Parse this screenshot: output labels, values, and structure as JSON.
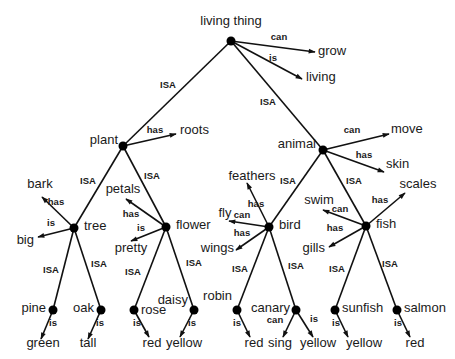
{
  "colors": {
    "line": "#111111",
    "node": "#000000",
    "text": "#1a1a1a",
    "background": "#ffffff"
  },
  "nodes": [
    {
      "id": "living_thing",
      "label": "living thing",
      "x": 231,
      "y": 41,
      "lx": 231,
      "ly": 25,
      "anchor": "middle"
    },
    {
      "id": "plant",
      "label": "plant",
      "x": 123,
      "y": 146,
      "lx": 118,
      "ly": 144,
      "anchor": "end"
    },
    {
      "id": "animal",
      "label": "animal",
      "x": 323,
      "y": 150,
      "lx": 316,
      "ly": 148,
      "anchor": "end"
    },
    {
      "id": "tree",
      "label": "tree",
      "x": 74,
      "y": 228,
      "lx": 84,
      "ly": 230,
      "anchor": "start"
    },
    {
      "id": "flower",
      "label": "flower",
      "x": 166,
      "y": 227,
      "lx": 176,
      "ly": 229,
      "anchor": "start"
    },
    {
      "id": "bird",
      "label": "bird",
      "x": 269,
      "y": 227,
      "lx": 279,
      "ly": 229,
      "anchor": "start"
    },
    {
      "id": "fish",
      "label": "fish",
      "x": 366,
      "y": 226,
      "lx": 376,
      "ly": 228,
      "anchor": "start"
    },
    {
      "id": "pine",
      "label": "pine",
      "x": 53,
      "y": 310,
      "lx": 46,
      "ly": 312,
      "anchor": "end"
    },
    {
      "id": "oak",
      "label": "oak",
      "x": 101,
      "y": 310,
      "lx": 94,
      "ly": 312,
      "anchor": "end"
    },
    {
      "id": "rose",
      "label": "rose",
      "x": 134,
      "y": 310,
      "lx": 141,
      "ly": 314,
      "anchor": "start"
    },
    {
      "id": "daisy",
      "label": "daisy",
      "x": 194,
      "y": 310,
      "lx": 188,
      "ly": 304,
      "anchor": "end"
    },
    {
      "id": "robin",
      "label": "robin",
      "x": 237,
      "y": 310,
      "lx": 232,
      "ly": 300,
      "anchor": "end"
    },
    {
      "id": "canary",
      "label": "canary",
      "x": 296,
      "y": 310,
      "lx": 290,
      "ly": 312,
      "anchor": "end"
    },
    {
      "id": "sunfish",
      "label": "sunfish",
      "x": 335,
      "y": 310,
      "lx": 342,
      "ly": 312,
      "anchor": "start"
    },
    {
      "id": "salmon",
      "label": "salmon",
      "x": 397,
      "y": 310,
      "lx": 404,
      "ly": 312,
      "anchor": "start"
    }
  ],
  "isa_edges": [
    {
      "from": "living_thing",
      "to": "plant",
      "label": "ISA",
      "lx": 168,
      "ly": 88
    },
    {
      "from": "living_thing",
      "to": "animal",
      "label": "ISA",
      "lx": 268,
      "ly": 105
    },
    {
      "from": "plant",
      "to": "tree",
      "label": "ISA",
      "lx": 88,
      "ly": 184
    },
    {
      "from": "plant",
      "to": "flower",
      "label": "ISA",
      "lx": 152,
      "ly": 179
    },
    {
      "from": "animal",
      "to": "bird",
      "label": "ISA",
      "lx": 288,
      "ly": 184
    },
    {
      "from": "animal",
      "to": "fish",
      "label": "ISA",
      "lx": 354,
      "ly": 184
    },
    {
      "from": "tree",
      "to": "pine",
      "label": "ISA",
      "lx": 51,
      "ly": 273
    },
    {
      "from": "tree",
      "to": "oak",
      "label": "ISA",
      "lx": 99,
      "ly": 267
    },
    {
      "from": "flower",
      "to": "rose",
      "label": "ISA",
      "lx": 133,
      "ly": 275
    },
    {
      "from": "flower",
      "to": "daisy",
      "label": "ISA",
      "lx": 194,
      "ly": 266
    },
    {
      "from": "bird",
      "to": "robin",
      "label": "ISA",
      "lx": 240,
      "ly": 272
    },
    {
      "from": "bird",
      "to": "canary",
      "label": "ISA",
      "lx": 296,
      "ly": 269
    },
    {
      "from": "fish",
      "to": "sunfish",
      "label": "ISA",
      "lx": 337,
      "ly": 272
    },
    {
      "from": "fish",
      "to": "salmon",
      "label": "ISA",
      "lx": 390,
      "ly": 267
    }
  ],
  "property_edges": [
    {
      "from": "living_thing",
      "tx": 315,
      "ty": 52,
      "rel": "can",
      "rlx": 279,
      "rly": 40,
      "value": "grow",
      "vx": 318,
      "vy": 55,
      "anchor": "start"
    },
    {
      "from": "living_thing",
      "tx": 302,
      "ty": 79,
      "rel": "is",
      "rlx": 273,
      "rly": 61,
      "value": "living",
      "vx": 306,
      "vy": 81,
      "anchor": "start"
    },
    {
      "from": "plant",
      "tx": 176,
      "ty": 134,
      "rel": "has",
      "rlx": 155,
      "rly": 133,
      "value": "roots",
      "vx": 180,
      "vy": 134,
      "anchor": "start"
    },
    {
      "from": "animal",
      "tx": 389,
      "ty": 134,
      "rel": "can",
      "rlx": 352,
      "rly": 133,
      "value": "move",
      "vx": 391,
      "vy": 133,
      "anchor": "start"
    },
    {
      "from": "animal",
      "tx": 384,
      "ty": 172,
      "rel": "has",
      "rlx": 364,
      "rly": 158,
      "value": "skin",
      "vx": 386,
      "vy": 168,
      "anchor": "start"
    },
    {
      "from": "tree",
      "tx": 42,
      "ty": 197,
      "rel": "has",
      "rlx": 56,
      "rly": 205,
      "value": "bark",
      "vx": 40,
      "vy": 188,
      "anchor": "middle"
    },
    {
      "from": "tree",
      "tx": 38,
      "ty": 237,
      "rel": "is",
      "rlx": 51,
      "rly": 226,
      "value": "big",
      "vx": 34,
      "vy": 244,
      "anchor": "end"
    },
    {
      "from": "flower",
      "tx": 126,
      "ty": 199,
      "rel": "has",
      "rlx": 131,
      "rly": 217,
      "value": "petals",
      "vx": 123,
      "vy": 193,
      "anchor": "middle"
    },
    {
      "from": "flower",
      "tx": 131,
      "ty": 241,
      "rel": "is",
      "rlx": 141,
      "rly": 231,
      "value": "pretty",
      "vx": 131,
      "vy": 252,
      "anchor": "middle"
    },
    {
      "from": "bird",
      "tx": 247,
      "ty": 183,
      "rel": "has",
      "rlx": 256,
      "rly": 207,
      "value": "feathers",
      "vx": 252,
      "vy": 180,
      "anchor": "middle"
    },
    {
      "from": "bird",
      "tx": 229,
      "ty": 221,
      "rel": "can",
      "rlx": 242,
      "rly": 218,
      "value": "fly",
      "vx": 225,
      "vy": 217,
      "anchor": "middle"
    },
    {
      "from": "bird",
      "tx": 236,
      "ty": 250,
      "rel": "has",
      "rlx": 242,
      "rly": 236,
      "value": "wings",
      "vx": 234,
      "vy": 252,
      "anchor": "end"
    },
    {
      "from": "fish",
      "tx": 323,
      "ty": 210,
      "rel": "can",
      "rlx": 340,
      "rly": 212,
      "value": "swim",
      "vx": 319,
      "vy": 204,
      "anchor": "middle"
    },
    {
      "from": "fish",
      "tx": 329,
      "ty": 247,
      "rel": "has",
      "rlx": 335,
      "rly": 231,
      "value": "gills",
      "vx": 325,
      "vy": 252,
      "anchor": "end"
    },
    {
      "from": "fish",
      "tx": 405,
      "ty": 193,
      "rel": "has",
      "rlx": 380,
      "rly": 203,
      "value": "scales",
      "vx": 418,
      "vy": 188,
      "anchor": "middle"
    },
    {
      "from": "pine",
      "tx": 41,
      "ty": 339,
      "rel": "is",
      "rlx": 53,
      "rly": 326,
      "value": "green",
      "vx": 43,
      "vy": 347,
      "anchor": "middle"
    },
    {
      "from": "oak",
      "tx": 88,
      "ty": 339,
      "rel": "is",
      "rlx": 100,
      "rly": 326,
      "value": "tall",
      "vx": 88,
      "vy": 347,
      "anchor": "middle"
    },
    {
      "from": "rose",
      "tx": 149,
      "ty": 337,
      "rel": "is",
      "rlx": 137,
      "rly": 326,
      "value": "red",
      "vx": 152,
      "vy": 347,
      "anchor": "middle"
    },
    {
      "from": "daisy",
      "tx": 180,
      "ty": 337,
      "rel": "is",
      "rlx": 192,
      "rly": 326,
      "value": "yellow",
      "vx": 184,
      "vy": 347,
      "anchor": "middle"
    },
    {
      "from": "robin",
      "tx": 250,
      "ty": 337,
      "rel": "is",
      "rlx": 237,
      "rly": 326,
      "value": "red",
      "vx": 254,
      "vy": 347,
      "anchor": "middle"
    },
    {
      "from": "canary",
      "tx": 283,
      "ty": 337,
      "rel": "can",
      "rlx": 275,
      "rly": 323,
      "value": "sing",
      "vx": 280,
      "vy": 347,
      "anchor": "middle"
    },
    {
      "from": "canary",
      "tx": 313,
      "ty": 337,
      "rel": "is",
      "rlx": 314,
      "rly": 322,
      "value": "yellow",
      "vx": 318,
      "vy": 347,
      "anchor": "middle"
    },
    {
      "from": "sunfish",
      "tx": 348,
      "ty": 337,
      "rel": "is",
      "rlx": 336,
      "rly": 326,
      "value": "yellow",
      "vx": 364,
      "vy": 347,
      "anchor": "middle"
    },
    {
      "from": "salmon",
      "tx": 410,
      "ty": 337,
      "rel": "is",
      "rlx": 398,
      "rly": 326,
      "value": "red",
      "vx": 415,
      "vy": 347,
      "anchor": "middle"
    }
  ]
}
